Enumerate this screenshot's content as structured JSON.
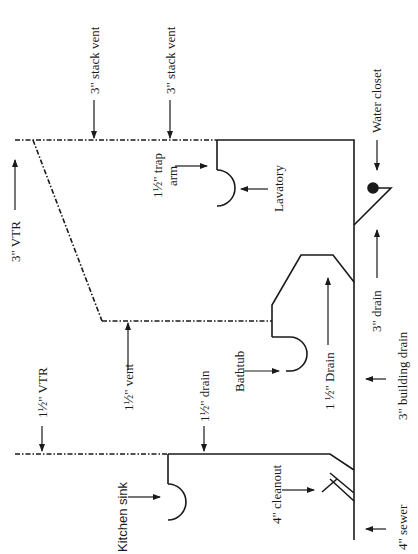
{
  "diagram": {
    "type": "plumbing DWV isometric (rotated)",
    "labels": {
      "stack_vent_1": "3\" stack vent",
      "stack_vent_2": "3\" stack vent",
      "vtr_3": "3\" VTR",
      "trap_arm_1": "1½\" trap",
      "trap_arm_2": "arm",
      "lavatory": "Lavatory",
      "water_closet": "Water closet",
      "drain_3": "3\" drain",
      "building_drain": "3\" building drain",
      "drain_15": "1 ½\" Drain",
      "bathtub": "Bathtub",
      "vent_15": "1½\" vent",
      "vtr_15": "1½\" VTR",
      "drain_15b": "1½\" drain",
      "kitchen_sink": "Kitchen sink",
      "cleanout": "4\" cleanout",
      "sewer": "4\" sewer"
    },
    "colors": {
      "line": "#1a1a1a",
      "background": "#ffffff"
    }
  }
}
